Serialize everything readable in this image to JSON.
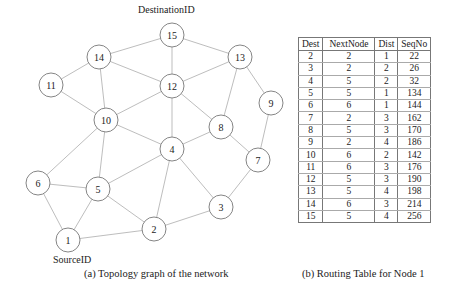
{
  "graph": {
    "destination_label": "DestinationID",
    "source_label": "SourceID",
    "caption": "(a) Topology graph of the network",
    "nodes": [
      {
        "id": "1",
        "x": 68,
        "y": 240
      },
      {
        "id": "2",
        "x": 154,
        "y": 229
      },
      {
        "id": "3",
        "x": 221,
        "y": 207
      },
      {
        "id": "4",
        "x": 172,
        "y": 149
      },
      {
        "id": "5",
        "x": 98,
        "y": 189
      },
      {
        "id": "6",
        "x": 38,
        "y": 183
      },
      {
        "id": "7",
        "x": 258,
        "y": 160
      },
      {
        "id": "8",
        "x": 221,
        "y": 127
      },
      {
        "id": "9",
        "x": 271,
        "y": 103
      },
      {
        "id": "10",
        "x": 106,
        "y": 120
      },
      {
        "id": "11",
        "x": 51,
        "y": 85
      },
      {
        "id": "12",
        "x": 172,
        "y": 86
      },
      {
        "id": "13",
        "x": 240,
        "y": 57
      },
      {
        "id": "14",
        "x": 99,
        "y": 57
      },
      {
        "id": "15",
        "x": 172,
        "y": 35
      }
    ],
    "edges": [
      [
        "15",
        "14"
      ],
      [
        "15",
        "13"
      ],
      [
        "15",
        "12"
      ],
      [
        "14",
        "11"
      ],
      [
        "14",
        "12"
      ],
      [
        "14",
        "10"
      ],
      [
        "13",
        "12"
      ],
      [
        "13",
        "8"
      ],
      [
        "13",
        "9"
      ],
      [
        "11",
        "10"
      ],
      [
        "12",
        "10"
      ],
      [
        "12",
        "4"
      ],
      [
        "12",
        "8"
      ],
      [
        "9",
        "7"
      ],
      [
        "10",
        "4"
      ],
      [
        "10",
        "5"
      ],
      [
        "10",
        "6"
      ],
      [
        "8",
        "4"
      ],
      [
        "8",
        "7"
      ],
      [
        "4",
        "5"
      ],
      [
        "4",
        "2"
      ],
      [
        "4",
        "3"
      ],
      [
        "7",
        "3"
      ],
      [
        "6",
        "5"
      ],
      [
        "6",
        "1"
      ],
      [
        "5",
        "1"
      ],
      [
        "5",
        "2"
      ],
      [
        "3",
        "2"
      ],
      [
        "2",
        "1"
      ]
    ]
  },
  "routing_table": {
    "caption": "(b) Routing Table for Node 1",
    "columns": [
      "Dest",
      "NextNode",
      "Dist",
      "SeqNo"
    ],
    "rows": [
      [
        "2",
        "2",
        "1",
        "22"
      ],
      [
        "3",
        "2",
        "2",
        "26"
      ],
      [
        "4",
        "5",
        "2",
        "32"
      ],
      [
        "5",
        "5",
        "1",
        "134"
      ],
      [
        "6",
        "6",
        "1",
        "144"
      ],
      [
        "7",
        "2",
        "3",
        "162"
      ],
      [
        "8",
        "5",
        "3",
        "170"
      ],
      [
        "9",
        "2",
        "4",
        "186"
      ],
      [
        "10",
        "6",
        "2",
        "142"
      ],
      [
        "11",
        "6",
        "3",
        "176"
      ],
      [
        "12",
        "5",
        "3",
        "190"
      ],
      [
        "13",
        "5",
        "4",
        "198"
      ],
      [
        "14",
        "6",
        "3",
        "214"
      ],
      [
        "15",
        "5",
        "4",
        "256"
      ]
    ]
  }
}
